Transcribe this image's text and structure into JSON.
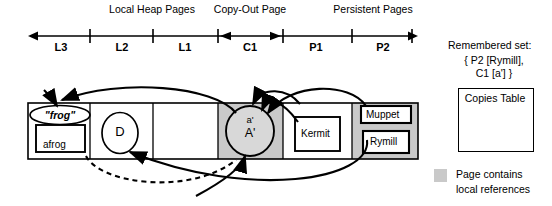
{
  "axis": {
    "group_labels": [
      {
        "text": "Local Heap Pages",
        "cx": 152,
        "y": 5
      },
      {
        "text": "Copy-Out Page",
        "cx": 250,
        "y": 5
      },
      {
        "text": "Persistent Pages",
        "cx": 373,
        "y": 5
      }
    ],
    "segments": [
      {
        "text": "L3",
        "cx": 61
      },
      {
        "text": "L2",
        "cx": 122
      },
      {
        "text": "L1",
        "cx": 185
      },
      {
        "text": "C1",
        "cx": 250
      },
      {
        "text": "P1",
        "cx": 316
      },
      {
        "text": "P2",
        "cx": 383
      }
    ],
    "ticks": [
      90,
      153,
      218,
      283,
      352
    ],
    "line_y": 36,
    "x_start": 28,
    "x_end": 418,
    "copyout_start": 218,
    "copyout_end": 283
  },
  "memory_strip": {
    "x": 28,
    "y": 103,
    "width": 390,
    "height": 56,
    "dividers": [
      90,
      153,
      218,
      283,
      352
    ],
    "shaded_pages": [
      {
        "x": 218,
        "width": 65,
        "name": "C1"
      },
      {
        "x": 352,
        "width": 66,
        "name": "P2"
      }
    ],
    "shade_color": "#c9c9c9"
  },
  "objects": {
    "frog_ellipse": {
      "label": "\"frog\"",
      "cx": 60,
      "cy": 115,
      "rx": 30,
      "ry": 9
    },
    "afrog_box": {
      "label": "afrog",
      "x": 36,
      "y": 125,
      "width": 49,
      "height": 27
    },
    "d_circle": {
      "label": "D",
      "cx": 120,
      "cy": 133,
      "rx": 18,
      "ry": 20
    },
    "aprime_circle": {
      "label_top": "a'",
      "label_bottom": "A'",
      "cx": 250,
      "cy": 131,
      "rx": 24,
      "ry": 25
    },
    "kermit_box": {
      "label": "Kermit",
      "x": 295,
      "y": 117,
      "width": 45,
      "height": 34
    },
    "muppet_box": {
      "label": "Muppet",
      "x": 361,
      "y": 106,
      "width": 50,
      "height": 17
    },
    "rymill_box": {
      "label": "Rymill",
      "x": 363,
      "y": 131,
      "width": 46,
      "height": 22
    }
  },
  "remembered_set": {
    "title": "Remembered set:",
    "line1": "{ P2 [Rymill],",
    "line2": "C1 [a'] }"
  },
  "copies_table": {
    "label": "Copies Table",
    "x": 458,
    "y": 88,
    "width": 74,
    "height": 62
  },
  "legend": {
    "swatch_color": "#c9c9c9",
    "line1": "Page contains",
    "line2": "local references"
  }
}
